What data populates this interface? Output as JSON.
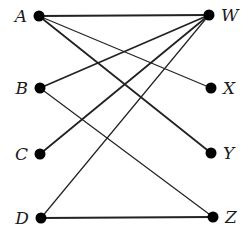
{
  "diagram": {
    "type": "bipartite-graph",
    "left_nodes": [
      {
        "id": "A",
        "label": "A",
        "x": 39,
        "y": 16
      },
      {
        "id": "B",
        "label": "B",
        "x": 40,
        "y": 88
      },
      {
        "id": "C",
        "label": "C",
        "x": 40,
        "y": 154
      },
      {
        "id": "D",
        "label": "D",
        "x": 41,
        "y": 218
      }
    ],
    "right_nodes": [
      {
        "id": "W",
        "label": "W",
        "x": 209,
        "y": 15
      },
      {
        "id": "X",
        "label": "X",
        "x": 211,
        "y": 88
      },
      {
        "id": "Y",
        "label": "Y",
        "x": 211,
        "y": 153
      },
      {
        "id": "Z",
        "label": "Z",
        "x": 213,
        "y": 217
      }
    ],
    "edges": [
      {
        "from": "A",
        "to": "W",
        "weight": 2
      },
      {
        "from": "A",
        "to": "X",
        "weight": 1.2
      },
      {
        "from": "A",
        "to": "Y",
        "weight": 1.8
      },
      {
        "from": "B",
        "to": "W",
        "weight": 1.8
      },
      {
        "from": "B",
        "to": "Z",
        "weight": 1.2
      },
      {
        "from": "C",
        "to": "W",
        "weight": 1.8
      },
      {
        "from": "D",
        "to": "W",
        "weight": 1.2
      },
      {
        "from": "D",
        "to": "Z",
        "weight": 2
      }
    ],
    "colors": {
      "line": "#222222",
      "node": "#000000",
      "text": "#1a1a1a"
    }
  }
}
